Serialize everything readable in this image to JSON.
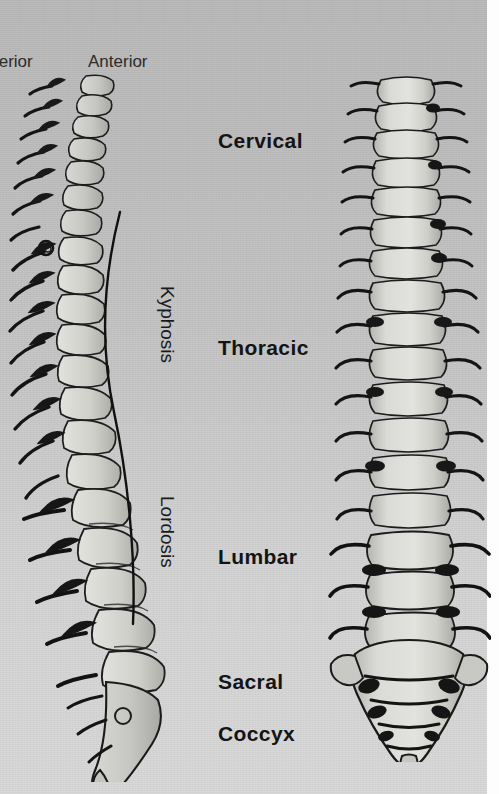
{
  "figure": {
    "background_upper_color": "#b6b6b6",
    "background_lower_color": "#cccccc",
    "ink_color": "#141414"
  },
  "orientation_labels": [
    {
      "name": "posterior",
      "text": "terior",
      "full_text": "Posterior",
      "clipped": true
    },
    {
      "name": "anterior",
      "text": "Anterior",
      "full_text": "Anterior",
      "clipped": false
    }
  ],
  "region_labels": [
    {
      "name": "cervical",
      "text": "Cervical"
    },
    {
      "name": "thoracic",
      "text": "Thoracic"
    },
    {
      "name": "lumbar",
      "text": "Lumbar"
    },
    {
      "name": "sacral",
      "text": "Sacral"
    },
    {
      "name": "coccyx",
      "text": "Coccyx"
    }
  ],
  "curvature_labels": [
    {
      "name": "kyphosis",
      "text": "Kyphosis"
    },
    {
      "name": "lordosis",
      "text": "Lordosis"
    }
  ],
  "illustrations": [
    {
      "name": "lateral-spine",
      "view": "lateral",
      "description": "Side view of the vertebral column showing the S-shaped curvature"
    },
    {
      "name": "frontal-spine",
      "view": "anterior",
      "description": "Front view of the vertebral column with sacrum and coccyx"
    },
    {
      "name": "curvature-curve",
      "description": "S-shaped line tracing the kyphotic and lordotic curves"
    }
  ]
}
